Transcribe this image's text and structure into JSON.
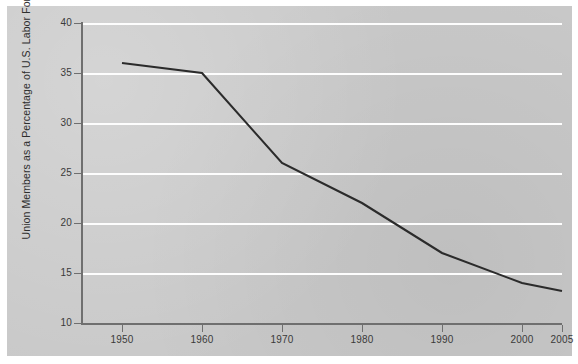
{
  "chart_data": {
    "type": "line",
    "title": "",
    "subtitle": "",
    "xlabel": "",
    "ylabel": "Union Members as a Percentage of U.S. Labor Force",
    "x": [
      1950,
      1960,
      1970,
      1980,
      1990,
      2000,
      2005
    ],
    "values": [
      36.0,
      35.0,
      26.0,
      22.0,
      17.0,
      14.0,
      13.2
    ],
    "series": [
      {
        "name": "Union membership rate",
        "values": [
          36.0,
          35.0,
          26.0,
          22.0,
          17.0,
          14.0,
          13.2
        ]
      }
    ],
    "xtick_labels": [
      "1950",
      "1960",
      "1970",
      "1980",
      "1990",
      "2000",
      "2005"
    ],
    "ytick_labels": [
      "40",
      "35",
      "30",
      "25",
      "20",
      "15",
      "10"
    ],
    "ytick_values": [
      40,
      35,
      30,
      25,
      20,
      15,
      10
    ],
    "xlim": [
      1945,
      2005
    ],
    "ylim": [
      10,
      40
    ],
    "grid": "horizontal",
    "legend": "none",
    "line_color": "#2b2b2b",
    "gridline_color": "#fdfdfd",
    "axis_color": "#6f6f6f",
    "plot_background": "#c9c9c9"
  }
}
